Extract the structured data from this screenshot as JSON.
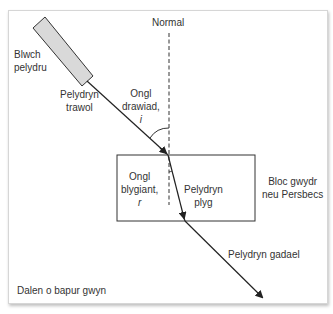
{
  "diagram": {
    "type": "refraction-through-glass-block",
    "labels": {
      "normal": "Normal",
      "ray_box_line1": "Blwch",
      "ray_box_line2": "pelydru",
      "incident_ray_line1": "Pelydryn",
      "incident_ray_line2": "trawol",
      "angle_incidence_line1": "Ongl",
      "angle_incidence_line2": "drawiad,",
      "angle_incidence_symbol": "i",
      "angle_refraction_line1": "Ongl",
      "angle_refraction_line2": "blygiant,",
      "angle_refraction_symbol": "r",
      "refracted_ray_line1": "Pelydryn",
      "refracted_ray_line2": "plyg",
      "block_line1": "Bloc gwydr",
      "block_line2": "neu Persbecs",
      "emergent_ray": "Pelydryn gadael",
      "paper": "Dalen o bapur gwyn"
    },
    "colors": {
      "line": "#333333",
      "ray_box_fill": "#d9d9d9",
      "text": "#333333"
    }
  }
}
